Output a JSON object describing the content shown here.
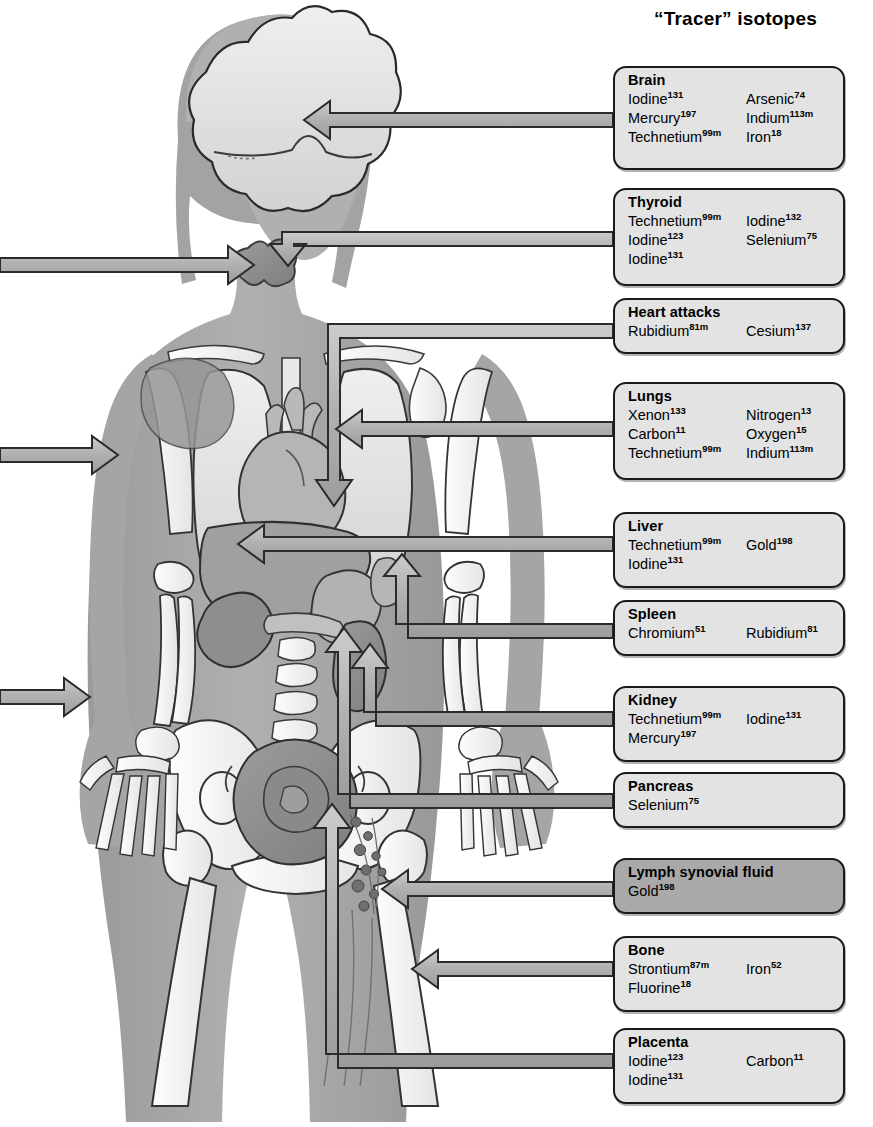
{
  "title": "“Tracer” isotopes",
  "colors": {
    "box_fill": "#e3e3e3",
    "box_fill_highlight": "#a9a9a9",
    "box_stroke": "#1a1a1a",
    "body_silhouette": "#a8a8a8",
    "organ_light": "#e0e0e0",
    "arrow_fill": "#b4b4b4",
    "arrow_stroke": "#2b2b2b",
    "bone": "#f2f2f2"
  },
  "figure": {
    "organs": [
      "brain",
      "thyroid",
      "lungs",
      "heart",
      "liver",
      "spleen",
      "kidney",
      "pancreas",
      "lymph-nodes",
      "bone",
      "uterus-placenta"
    ]
  },
  "boxes": [
    {
      "id": "brain",
      "organ": "Brain",
      "highlight": false,
      "rows": [
        {
          "left": {
            "name": "Iodine",
            "mass": "131"
          },
          "right": {
            "name": "Arsenic",
            "mass": "74"
          }
        },
        {
          "left": {
            "name": "Mercury",
            "mass": "197"
          },
          "right": {
            "name": "Indium",
            "mass": "113m"
          }
        },
        {
          "left": {
            "name": "Technetium",
            "mass": "99m"
          },
          "right": {
            "name": "Iron",
            "mass": "18"
          }
        }
      ]
    },
    {
      "id": "thyroid",
      "organ": "Thyroid",
      "highlight": false,
      "rows": [
        {
          "left": {
            "name": "Technetium",
            "mass": "99m"
          },
          "right": {
            "name": "Iodine",
            "mass": "132"
          }
        },
        {
          "left": {
            "name": "Iodine",
            "mass": "123"
          },
          "right": {
            "name": "Selenium",
            "mass": "75"
          }
        },
        {
          "left": {
            "name": "Iodine",
            "mass": "131"
          },
          "right": null
        }
      ]
    },
    {
      "id": "heart-attacks",
      "organ": "Heart attacks",
      "highlight": false,
      "rows": [
        {
          "left": {
            "name": "Rubidium",
            "mass": "81m"
          },
          "right": {
            "name": "Cesium",
            "mass": "137"
          }
        }
      ]
    },
    {
      "id": "lungs",
      "organ": "Lungs",
      "highlight": false,
      "rows": [
        {
          "left": {
            "name": "Xenon",
            "mass": "133"
          },
          "right": {
            "name": "Nitrogen",
            "mass": "13"
          }
        },
        {
          "left": {
            "name": "Carbon",
            "mass": "11"
          },
          "right": {
            "name": "Oxygen",
            "mass": "15"
          }
        },
        {
          "left": {
            "name": "Technetium",
            "mass": "99m"
          },
          "right": {
            "name": "Indium",
            "mass": "113m"
          }
        }
      ]
    },
    {
      "id": "liver",
      "organ": "Liver",
      "highlight": false,
      "rows": [
        {
          "left": {
            "name": "Technetium",
            "mass": "99m"
          },
          "right": {
            "name": "Gold",
            "mass": "198"
          }
        },
        {
          "left": {
            "name": "Iodine",
            "mass": "131"
          },
          "right": null
        }
      ]
    },
    {
      "id": "spleen",
      "organ": "Spleen",
      "highlight": false,
      "rows": [
        {
          "left": {
            "name": "Chromium",
            "mass": "51"
          },
          "right": {
            "name": "Rubidium",
            "mass": "81"
          }
        }
      ]
    },
    {
      "id": "kidney",
      "organ": "Kidney",
      "highlight": false,
      "rows": [
        {
          "left": {
            "name": "Technetium",
            "mass": "99m"
          },
          "right": {
            "name": "Iodine",
            "mass": "131"
          }
        },
        {
          "left": {
            "name": "Mercury",
            "mass": "197"
          },
          "right": null
        }
      ]
    },
    {
      "id": "pancreas",
      "organ": "Pancreas",
      "highlight": false,
      "rows": [
        {
          "left": {
            "name": "Selenium",
            "mass": "75"
          },
          "right": null
        }
      ]
    },
    {
      "id": "lymph-synovial-fluid",
      "organ": "Lymph synovial fluid",
      "highlight": true,
      "rows": [
        {
          "left": {
            "name": "Gold",
            "mass": "198"
          },
          "right": null
        }
      ]
    },
    {
      "id": "bone",
      "organ": "Bone",
      "highlight": false,
      "rows": [
        {
          "left": {
            "name": "Strontium",
            "mass": "87m"
          },
          "right": {
            "name": "Iron",
            "mass": "52"
          }
        },
        {
          "left": {
            "name": "Fluorine",
            "mass": "18"
          },
          "right": null
        }
      ]
    },
    {
      "id": "placenta",
      "organ": "Placenta",
      "highlight": false,
      "rows": [
        {
          "left": {
            "name": "Iodine",
            "mass": "123"
          },
          "right": {
            "name": "Carbon",
            "mass": "11"
          }
        },
        {
          "left": {
            "name": "Iodine",
            "mass": "131"
          },
          "right": null
        }
      ]
    }
  ]
}
